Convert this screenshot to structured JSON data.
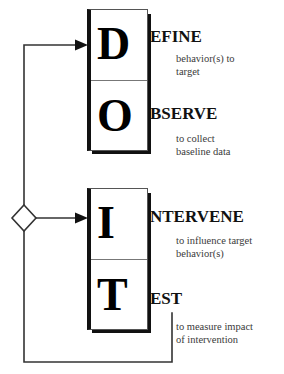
{
  "diagram": {
    "type": "flowchart",
    "colors": {
      "line": "#333333",
      "box_border": "#555555",
      "box_accent": "#111111",
      "text": "#111111",
      "desc_text": "#3a3a3a",
      "background": "#ffffff"
    },
    "boxes": [
      {
        "id": "box-upper",
        "cells": [
          {
            "drop_letter": "D",
            "label": "EFINE",
            "description": "behavior(s) to\ntarget"
          },
          {
            "drop_letter": "O",
            "label": "BSERVE",
            "description": "to collect\nbaseline data"
          }
        ]
      },
      {
        "id": "box-lower",
        "cells": [
          {
            "drop_letter": "I",
            "label": "NTERVENE",
            "description": "to influence target\nbehavior(s)"
          },
          {
            "drop_letter": "T",
            "label": "EST",
            "description": "to measure impact\nof intervention"
          }
        ]
      }
    ],
    "connectors": {
      "decision_node": "diamond",
      "arrow_to_define": "arrow-right",
      "arrow_to_intervene": "arrow-right",
      "feedback_loop": "test-to-decision"
    }
  }
}
